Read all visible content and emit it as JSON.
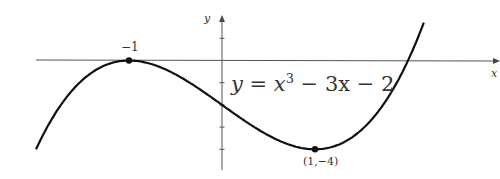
{
  "chart_data": {
    "type": "line",
    "title": "",
    "equation": "y = x³ − 3x − 2",
    "equation_parts": {
      "lhs": "y",
      "eq": "=",
      "x": "x",
      "exp": "3",
      "rest": " − 3x − 2"
    },
    "xlabel": "x",
    "ylabel": "y",
    "xlim": [
      -2.0,
      3.0
    ],
    "ylim": [
      -4.9,
      2.0
    ],
    "grid": false,
    "series": [
      {
        "name": "y = x^3 - 3x - 2",
        "function": "x^3 - 3x - 2",
        "x_range": [
          -2.0,
          2.17
        ]
      }
    ],
    "marked_points": [
      {
        "x": -1,
        "y": 0,
        "label": "−1"
      },
      {
        "x": 1,
        "y": -4,
        "label": "(1,−4)"
      }
    ],
    "y_ticks": [
      1,
      -1,
      -2,
      -3,
      -4
    ],
    "colors": {
      "curve": "#111111",
      "axis": "#555555"
    }
  },
  "labels": {
    "x_axis": "x",
    "y_axis": "y",
    "point_max": "−1",
    "point_min": "(1,−4)",
    "eq_lhs": "y = ",
    "eq_x": "x",
    "eq_exp": "3",
    "eq_rest": " − 3x − 2"
  }
}
